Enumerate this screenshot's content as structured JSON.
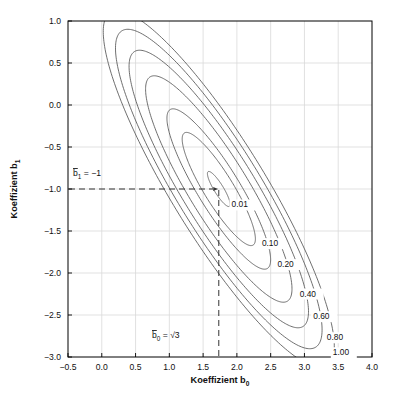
{
  "figure": {
    "background": "#ffffff",
    "plot_frame_color": "#000000",
    "grid_color": "#d9d9d9",
    "contour_color": "#555555",
    "dash_color": "#333333"
  },
  "axes": {
    "x_title": "Koeffizient b",
    "x_title_sub": "0",
    "y_title": "Koeffizient b",
    "y_title_sub": "1",
    "x_ticks": [
      "-0.5",
      "0.0",
      "0.5",
      "1.0",
      "1.5",
      "2.0",
      "2.5",
      "3.0",
      "3.5",
      "4.0"
    ],
    "y_ticks": [
      "1.0",
      "0.5",
      "0.0",
      "-0.5",
      "-1.0",
      "-1.5",
      "-2.0",
      "-2.5",
      "-3.0"
    ],
    "xlim": [
      -0.5,
      4.0
    ],
    "ylim": [
      -3.0,
      1.0
    ]
  },
  "annotations": {
    "hline": {
      "text_main": "b",
      "text_sub": "1",
      "text_rest": " = −1",
      "value": -1.0,
      "style": "dashed"
    },
    "vline": {
      "text_main": "b",
      "text_sub": "0",
      "text_rest": " = ",
      "text_radical": "√3",
      "value": 1.732,
      "style": "dashed"
    }
  },
  "chart_data": {
    "type": "line",
    "title": "",
    "xlabel": "Koeffizient b0",
    "ylabel": "Koeffizient b1",
    "xlim": [
      -0.5,
      4.0
    ],
    "ylim": [
      -3.0,
      1.0
    ],
    "grid": true,
    "legend": "none",
    "plot_kind": "contour",
    "center": [
      1.732,
      -1.0
    ],
    "contour_levels": [
      "0.01",
      "0.10",
      "0.20",
      "0.40",
      "0.60",
      "0.80",
      "1.00"
    ],
    "contour_level_values": [
      0.01,
      0.1,
      0.2,
      0.4,
      0.6,
      0.8,
      1.0
    ],
    "contour_label_positions": [
      {
        "level": "0.01",
        "x": 1.92,
        "y": -1.22
      },
      {
        "level": "0.10",
        "x": 2.37,
        "y": -1.68
      },
      {
        "level": "0.20",
        "x": 2.6,
        "y": -1.93
      },
      {
        "level": "0.40",
        "x": 2.93,
        "y": -2.28
      },
      {
        "level": "0.60",
        "x": 3.13,
        "y": -2.55
      },
      {
        "level": "0.80",
        "x": 3.33,
        "y": -2.8
      },
      {
        "level": "1.00",
        "x": 3.42,
        "y": -2.98
      }
    ],
    "ellipse_params": [
      {
        "level": "0.01",
        "semi_major": 0.26,
        "semi_minor": 0.065,
        "angle_deg": -52
      },
      {
        "level": "0.10",
        "semi_major": 0.84,
        "semi_minor": 0.205,
        "angle_deg": -52
      },
      {
        "level": "0.20",
        "semi_major": 1.19,
        "semi_minor": 0.29,
        "angle_deg": -52
      },
      {
        "level": "0.40",
        "semi_major": 1.68,
        "semi_minor": 0.41,
        "angle_deg": -52
      },
      {
        "level": "0.60",
        "semi_major": 2.06,
        "semi_minor": 0.5,
        "angle_deg": -52
      },
      {
        "level": "0.80",
        "semi_major": 2.37,
        "semi_minor": 0.58,
        "angle_deg": -52
      },
      {
        "level": "1.00",
        "semi_major": 2.65,
        "semi_minor": 0.65,
        "angle_deg": -52
      }
    ]
  },
  "caption": {
    "text": ""
  }
}
